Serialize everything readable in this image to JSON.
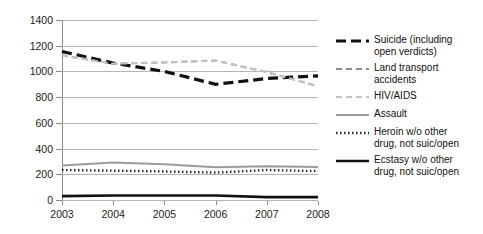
{
  "chart_data": {
    "type": "line",
    "title": "",
    "xlabel": "",
    "ylabel": "",
    "x": [
      2003,
      2004,
      2005,
      2006,
      2007,
      2008
    ],
    "categories": [
      "2003",
      "2004",
      "2005",
      "2006",
      "2007",
      "2008"
    ],
    "ylim": [
      0,
      1400
    ],
    "yticks": [
      0,
      200,
      400,
      600,
      800,
      1000,
      1200,
      1400
    ],
    "ytick_labels": [
      "0",
      "200",
      "400",
      "600",
      "800",
      "1000",
      "1200",
      "1400"
    ],
    "grid": true,
    "legend_position": "right",
    "series": [
      {
        "name": "Suicide (including open verdicts)",
        "values": [
          1155,
          1065,
          1000,
          900,
          945,
          965
        ],
        "style": "dashed",
        "color": "#111111",
        "width": 3.2,
        "dash": "10,5"
      },
      {
        "name": "Land transport accidents",
        "values": [
          1125,
          1060,
          1070,
          1085,
          995,
          885
        ],
        "style": "dashed",
        "color": "#8c8c8c",
        "width": 2,
        "dash": "6,4"
      },
      {
        "name": "HIV/AIDS",
        "values": [
          1125,
          1060,
          1070,
          1085,
          995,
          885
        ],
        "style": "dashed",
        "color": "#c4c4c4",
        "width": 2,
        "dash": "6,4"
      },
      {
        "name": "Assault",
        "values": [
          268,
          292,
          278,
          255,
          262,
          257
        ],
        "style": "solid",
        "color": "#9a9a9a",
        "width": 2,
        "dash": "none"
      },
      {
        "name": "Heroin w/o other drug, not suic/open",
        "values": [
          233,
          228,
          222,
          213,
          233,
          225
        ],
        "style": "dotted",
        "color": "#2b2b2b",
        "width": 2.4,
        "dash": "1.5,2.5"
      },
      {
        "name": "Ecstasy w/o other drug, not suic/open",
        "values": [
          30,
          35,
          35,
          35,
          22,
          22
        ],
        "style": "solid",
        "color": "#111111",
        "width": 2.6,
        "dash": "none"
      }
    ]
  },
  "legend": {
    "entries": [
      {
        "label": "Suicide (including\nopen verdicts)",
        "key": "thick-black-dash-key"
      },
      {
        "label": "Land transport\naccidents",
        "key": "gray-dash-key"
      },
      {
        "label": "HIV/AIDS",
        "key": "light-gray-dash-key"
      },
      {
        "label": "Assault",
        "key": "gray-solid-key"
      },
      {
        "label": "Heroin w/o other\ndrug, not suic/open",
        "key": "black-dotted-key"
      },
      {
        "label": "Ecstasy w/o other\ndrug, not suic/open",
        "key": "thick-black-solid-key"
      }
    ]
  }
}
